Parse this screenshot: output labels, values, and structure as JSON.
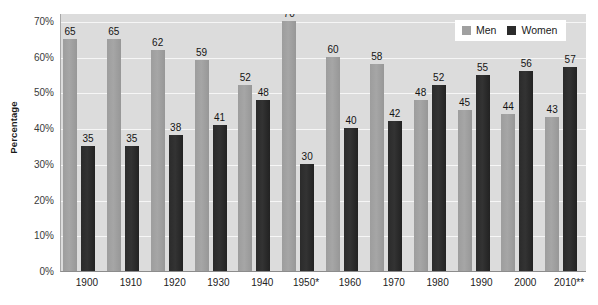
{
  "chart_data": {
    "type": "bar",
    "title": "",
    "xlabel": "",
    "ylabel": "Percentage",
    "ylim": [
      0,
      70
    ],
    "ytick_values": [
      70,
      60,
      50,
      40,
      30,
      20,
      10,
      0
    ],
    "ytick_labels": [
      "70%",
      "60%",
      "50%",
      "40%",
      "30%",
      "20%",
      "10%",
      "0%"
    ],
    "grid": true,
    "legend_position": "top-right",
    "categories": [
      "1900",
      "1910",
      "1920",
      "1930",
      "1940",
      "1950*",
      "1960",
      "1970",
      "1980",
      "1990",
      "2000",
      "2010**"
    ],
    "series": [
      {
        "name": "Men",
        "color": "#a0a0a0",
        "values": [
          65,
          65,
          62,
          59,
          52,
          70,
          60,
          58,
          48,
          45,
          44,
          43
        ]
      },
      {
        "name": "Women",
        "color": "#2b2b2b",
        "values": [
          35,
          35,
          38,
          41,
          48,
          30,
          40,
          42,
          52,
          55,
          56,
          57
        ]
      }
    ]
  },
  "legend": {
    "items": [
      {
        "label": "Men",
        "swatch": "men"
      },
      {
        "label": "Women",
        "swatch": "women"
      }
    ]
  },
  "colors": {
    "plot_background": "#dcdcdc",
    "gridline": "#f6f6f6",
    "men_bar": "#a0a0a0",
    "women_bar": "#2b2b2b",
    "label_text": "#141414"
  }
}
